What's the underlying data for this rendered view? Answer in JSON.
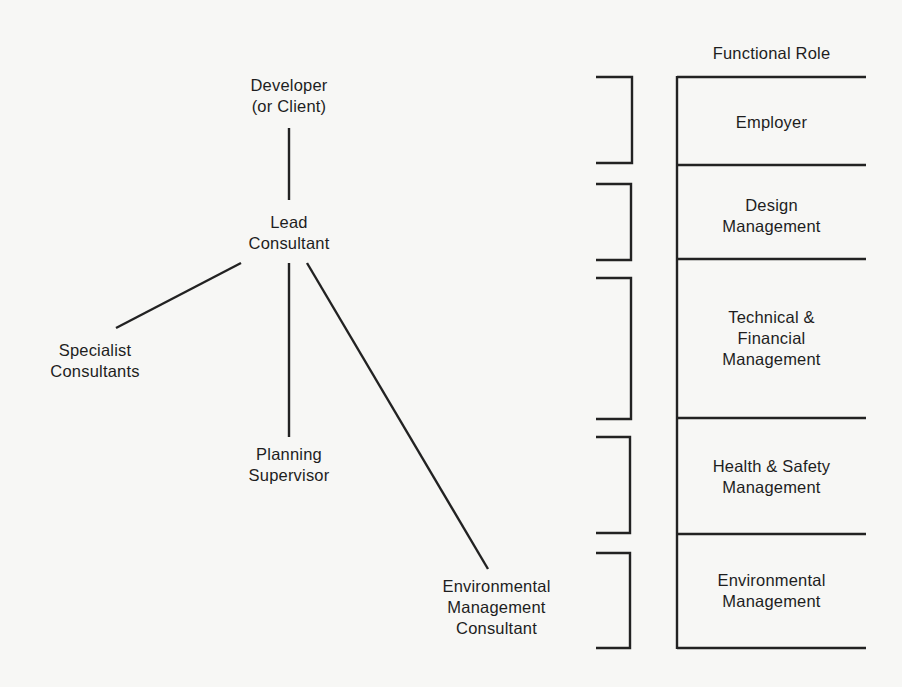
{
  "diagram": {
    "type": "organization-chart",
    "org_nodes": [
      {
        "id": "developer",
        "label": "Developer\n(or Client)"
      },
      {
        "id": "lead",
        "label": "Lead\nConsultant"
      },
      {
        "id": "specialist",
        "label": "Specialist\nConsultants"
      },
      {
        "id": "planning",
        "label": "Planning\nSupervisor"
      },
      {
        "id": "environmental",
        "label": "Environmental\nManagement\nConsultant"
      }
    ],
    "connections": [
      {
        "from": "developer",
        "to": "lead"
      },
      {
        "from": "lead",
        "to": "specialist"
      },
      {
        "from": "lead",
        "to": "planning"
      },
      {
        "from": "lead",
        "to": "environmental"
      }
    ],
    "functional_role": {
      "header": "Functional Role",
      "rows": [
        {
          "label": "Employer"
        },
        {
          "label": "Design\nManagement"
        },
        {
          "label": "Technical &\nFinancial\nManagement"
        },
        {
          "label": "Health & Safety\nManagement"
        },
        {
          "label": "Environmental\nManagement"
        }
      ]
    }
  }
}
